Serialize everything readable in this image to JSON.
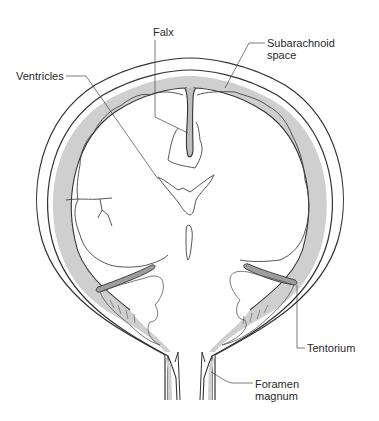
{
  "diagram": {
    "labels": {
      "falx": "Falx",
      "subarachnoid_line1": "Subarachnoid",
      "subarachnoid_line2": "space",
      "ventricles": "Ventricles",
      "tentorium": "Tentorium",
      "foramen_line1": "Foramen",
      "foramen_line2": "magnum"
    },
    "colors": {
      "stroke": "#333333",
      "csf_fill": "#cfcfcf",
      "background": "#ffffff",
      "leader": "#444444"
    }
  }
}
